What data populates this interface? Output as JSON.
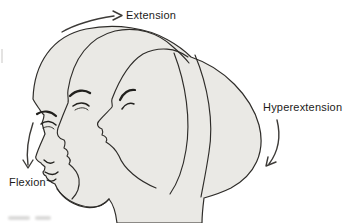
{
  "labels": {
    "extension": "Extension",
    "flexion": "Flexion",
    "hyperextension": "Hyperextension"
  },
  "colors": {
    "background": "#ffffff",
    "head_fill": "#eae9e5",
    "outline": "#2e2c29",
    "feature_stroke": "#21201d",
    "arrow": "#3d3b38",
    "text": "#1c1b19"
  },
  "icons": {
    "extension_arrow": "curved-arrow-right-icon",
    "flexion_arrow": "curved-arrow-down-icon",
    "hyperextension_arrow": "curved-arrow-down-left-icon"
  }
}
